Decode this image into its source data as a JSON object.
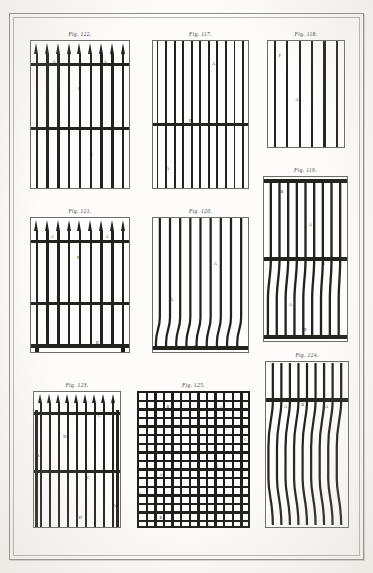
{
  "plate": {
    "medium": "engraving",
    "ink_color": "#24221f",
    "paper_color": "#fdfcfa",
    "frame_color": "#8d8c88"
  },
  "figures": [
    {
      "id": "fig-122",
      "label": "Fig. 122.",
      "kind": "spear-top-railing",
      "bar_count": 9,
      "rail_count": 2,
      "has_spear_tips": true,
      "annotations": [
        {
          "letter": "A",
          "x": 22,
          "y": 13
        },
        {
          "letter": "A",
          "x": 74,
          "y": 13
        },
        {
          "letter": "B",
          "x": 48,
          "y": 31
        },
        {
          "letter": "B",
          "x": 60,
          "y": 76
        }
      ]
    },
    {
      "id": "fig-117",
      "label": "Fig. 117.",
      "kind": "straight-bar-railing",
      "bar_count": 11,
      "rail_count": 1,
      "has_spear_tips": false,
      "annotations": [
        {
          "letter": "A",
          "x": 62,
          "y": 14
        },
        {
          "letter": "B",
          "x": 38,
          "y": 53
        },
        {
          "letter": "A",
          "x": 14,
          "y": 86
        }
      ]
    },
    {
      "id": "fig-118",
      "label": "Fig. 118.",
      "kind": "plain-bar-panel",
      "bar_count": 6,
      "rail_count": 0,
      "has_spear_tips": false,
      "annotations": [
        {
          "letter": "F",
          "x": 14,
          "y": 12
        },
        {
          "letter": "A",
          "x": 36,
          "y": 54
        }
      ]
    },
    {
      "id": "fig-121",
      "label": "Fig. 121.",
      "kind": "spear-top-railing-with-base",
      "bar_count": 9,
      "rail_count": 2,
      "has_spear_tips": true,
      "annotations": [
        {
          "letter": "A",
          "x": 20,
          "y": 13
        },
        {
          "letter": "A",
          "x": 76,
          "y": 13
        },
        {
          "letter": "B",
          "x": 47,
          "y": 28
        },
        {
          "letter": "B",
          "x": 26,
          "y": 58
        },
        {
          "letter": "B",
          "x": 66,
          "y": 92
        }
      ]
    },
    {
      "id": "fig-120",
      "label": "Fig. 120.",
      "kind": "serpentine-bars",
      "bar_count": 9,
      "rail_count": 1,
      "has_spear_tips": false,
      "annotations": [
        {
          "letter": "A",
          "x": 64,
          "y": 33
        },
        {
          "letter": "A",
          "x": 18,
          "y": 60
        },
        {
          "letter": "B",
          "x": 43,
          "y": 95
        }
      ]
    },
    {
      "id": "fig-119",
      "label": "Fig. 119.",
      "kind": "serpentine-bars-two-register",
      "bar_count": 9,
      "rail_count": 3,
      "has_spear_tips": false,
      "annotations": [
        {
          "letter": "B",
          "x": 20,
          "y": 8
        },
        {
          "letter": "A",
          "x": 54,
          "y": 28
        },
        {
          "letter": "B",
          "x": 70,
          "y": 52
        },
        {
          "letter": "A",
          "x": 30,
          "y": 77
        },
        {
          "letter": "B",
          "x": 48,
          "y": 92
        }
      ]
    },
    {
      "id": "fig-123",
      "label": "Fig. 123.",
      "kind": "spear-top-railing-tall",
      "bar_count": 9,
      "rail_count": 2,
      "has_spear_tips": true,
      "annotations": [
        {
          "letter": "C",
          "x": 74,
          "y": 16
        },
        {
          "letter": "D",
          "x": 34,
          "y": 32
        },
        {
          "letter": "B",
          "x": 3,
          "y": 46
        },
        {
          "letter": "C",
          "x": 62,
          "y": 62
        },
        {
          "letter": "A",
          "x": 92,
          "y": 83
        },
        {
          "letter": "D",
          "x": 52,
          "y": 92
        }
      ]
    },
    {
      "id": "fig-125",
      "label": "Fig. 125.",
      "kind": "lattice-grid",
      "cells_across": 13,
      "cells_down": 17,
      "annotations": [
        {
          "letter": "B",
          "x": 26,
          "y": 10
        },
        {
          "letter": "A",
          "x": 73,
          "y": 11
        },
        {
          "letter": "C",
          "x": 95,
          "y": 34
        },
        {
          "letter": "B",
          "x": 69,
          "y": 54
        },
        {
          "letter": "A",
          "x": 20,
          "y": 60
        },
        {
          "letter": "C",
          "x": 2,
          "y": 74
        },
        {
          "letter": "B",
          "x": 20,
          "y": 91
        },
        {
          "letter": "A",
          "x": 62,
          "y": 97
        }
      ]
    },
    {
      "id": "fig-124",
      "label": "Fig. 124.",
      "kind": "offset-serpentine-bars",
      "bar_count": 9,
      "rail_count": 1,
      "has_spear_tips": false,
      "annotations": [
        {
          "letter": "A",
          "x": 22,
          "y": 26
        },
        {
          "letter": "B",
          "x": 43,
          "y": 25
        },
        {
          "letter": "A",
          "x": 72,
          "y": 26
        }
      ]
    }
  ]
}
